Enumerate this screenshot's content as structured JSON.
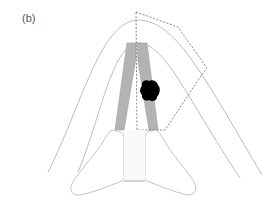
{
  "figure": {
    "panel_label": "(b)",
    "colors": {
      "outline": "#b8b8b8",
      "vocal_fold_fill": "#b3b3b3",
      "lesion_fill": "#000000",
      "dashed_region": "#666666",
      "background": "#ffffff"
    }
  }
}
